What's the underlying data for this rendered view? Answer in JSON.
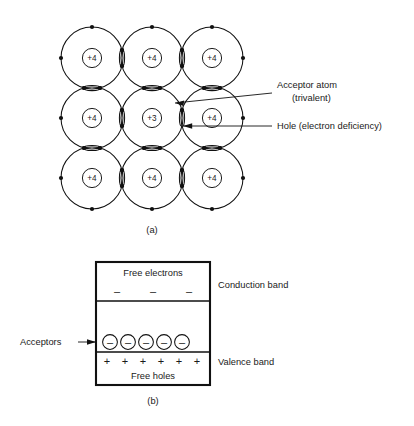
{
  "figure": {
    "part_a": {
      "caption": "(a)",
      "lattice": {
        "rows": 3,
        "cols": 3,
        "cores": [
          [
            "+4",
            "+4",
            "+4"
          ],
          [
            "+4",
            "+3",
            "+4"
          ],
          [
            "+4",
            "+4",
            "+4"
          ]
        ],
        "center_core": "+3",
        "normal_core": "+4"
      },
      "annotations": [
        {
          "id": "acceptor",
          "line1": "Acceptor atom",
          "line2": "(trivalent)"
        },
        {
          "id": "hole",
          "line1": "Hole (electron deficiency)",
          "line2": ""
        }
      ]
    },
    "part_b": {
      "caption": "(b)",
      "conduction_band": {
        "label": "Conduction band",
        "inner_text": "Free electrons",
        "carrier_symbol": "–",
        "carrier_count": 3
      },
      "acceptor_level": {
        "label": "Acceptors",
        "symbol": "–",
        "count": 5
      },
      "valence_band": {
        "label": "Valence band",
        "inner_text": "Free holes",
        "carrier_symbol": "+",
        "carrier_count": 6
      }
    }
  },
  "colors": {
    "ink": "#111111",
    "paper": "#ffffff"
  }
}
